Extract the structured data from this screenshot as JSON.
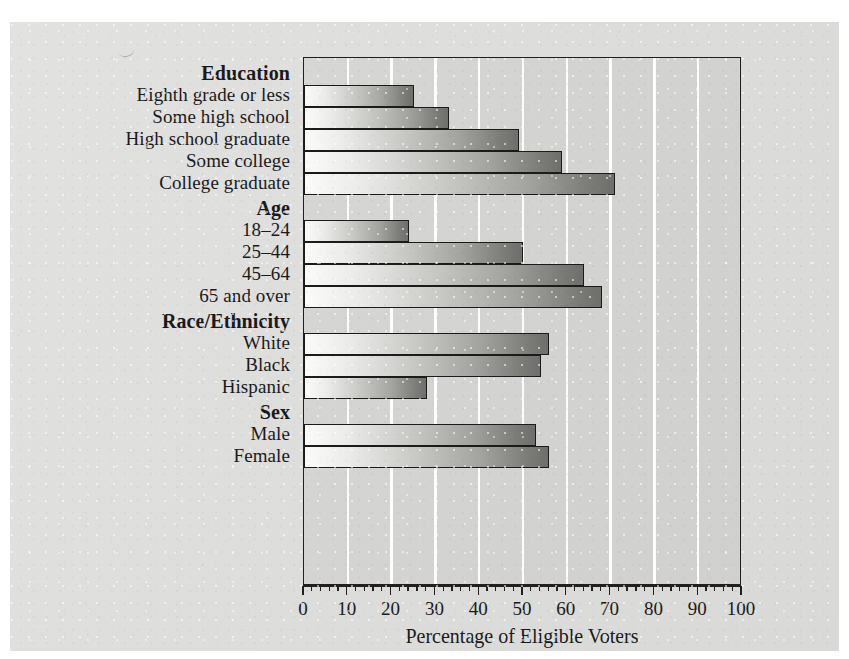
{
  "chart_data": {
    "type": "bar",
    "orientation": "horizontal",
    "title": "",
    "xlabel": "Percentage of Eligible Voters",
    "ylabel": "",
    "xlim": [
      0,
      100
    ],
    "xticks": [
      "0",
      "10",
      "20",
      "30",
      "40",
      "50",
      "60",
      "70",
      "80",
      "90",
      "100"
    ],
    "xtick_step": 10,
    "minor_tick_step": 2,
    "grid": "vertical white gridlines every 10 units",
    "legend": "none",
    "groups": [
      {
        "name": "Education",
        "categories": [
          "Eighth grade or less",
          "Some high school",
          "High school graduate",
          "Some college",
          "College graduate"
        ],
        "values": [
          25,
          33,
          49,
          59,
          71
        ]
      },
      {
        "name": "Age",
        "categories": [
          "18–24",
          "25–44",
          "45–64",
          "65 and over"
        ],
        "values": [
          24,
          50,
          64,
          68
        ]
      },
      {
        "name": "Race/Ethnicity",
        "categories": [
          "White",
          "Black",
          "Hispanic"
        ],
        "values": [
          56,
          54,
          28
        ]
      },
      {
        "name": "Sex",
        "categories": [
          "Male",
          "Female"
        ],
        "values": [
          53,
          56
        ]
      }
    ],
    "categories": [
      "Eighth grade or less",
      "Some high school",
      "High school graduate",
      "Some college",
      "College graduate",
      "18–24",
      "25–44",
      "45–64",
      "65 and over",
      "White",
      "Black",
      "Hispanic",
      "Male",
      "Female"
    ],
    "values": [
      25,
      33,
      49,
      59,
      71,
      24,
      50,
      64,
      68,
      56,
      54,
      28,
      53,
      56
    ]
  },
  "colors": {
    "paper": "#dcdcda",
    "plot_background": "#d3d3d1",
    "gridline": "#fdfdfc",
    "bar_light": "#fbfbfa",
    "bar_dark": "#6e6e6a",
    "frame": "#231f20",
    "text": "#1a1a1a"
  },
  "axis": {
    "title": "Percentage of Eligible Voters"
  }
}
